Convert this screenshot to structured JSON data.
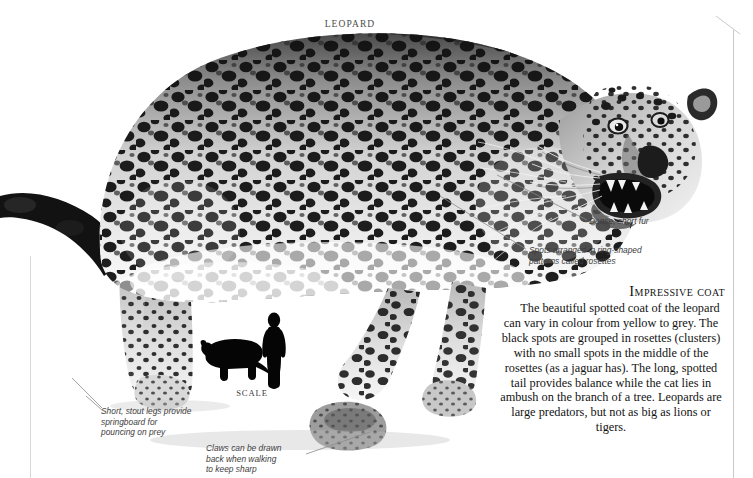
{
  "page": {
    "title": "LEOPARD",
    "background_color": "#ffffff",
    "rule_color": "#c9c9c9"
  },
  "photo": {
    "subject": "leopard",
    "style": "black-and-white photograph",
    "description": "Walking leopard in profile, head turned toward viewer, snarling with open mouth, dense rosette-spotted coat, long tail extending to left edge"
  },
  "annotations": [
    {
      "id": "dense-short-fur",
      "text": "Dense, short fur"
    },
    {
      "id": "rosettes",
      "text": "Spots arranged in ring-shaped\npatterns called rosettes"
    },
    {
      "id": "short-stout-legs",
      "text": "Short, stout legs provide\nspringboard for\npouncing on prey"
    },
    {
      "id": "claws",
      "text": "Claws can be drawn\nback when walking\nto keep sharp"
    }
  ],
  "scale": {
    "label": "SCALE",
    "silhouettes": [
      "leopard-silhouette",
      "human-silhouette"
    ],
    "color": "#000000"
  },
  "article": {
    "heading": "Impressive coat",
    "body": "The beautiful spotted coat of the leopard can vary in colour from yellow to grey. The black spots are grouped in rosettes (clusters) with no small spots in the middle of the rosettes (as a jaguar has). The long, spotted tail provides balance while the cat lies in ambush on the branch of a tree. Leopards are large predators, but not as big as lions or tigers."
  }
}
